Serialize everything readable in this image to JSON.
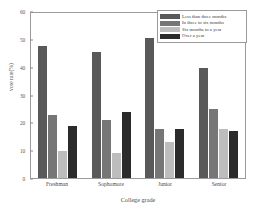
{
  "chart_data": {
    "type": "bar",
    "title": "",
    "xlabel": "College grade",
    "ylabel": "vote rate(%)",
    "categories": [
      "Freshman",
      "Sophomore",
      "Junior",
      "Senior"
    ],
    "ylim": [
      0,
      60
    ],
    "yticks": [
      0,
      10,
      20,
      30,
      40,
      50,
      60
    ],
    "grid": false,
    "legend_position": "top-right",
    "series": [
      {
        "name": "Less than three months",
        "color": "#595959",
        "values": [
          48,
          46,
          51,
          40
        ]
      },
      {
        "name": "In three to six months",
        "color": "#767676",
        "values": [
          23,
          21,
          18,
          25
        ]
      },
      {
        "name": "Six months to a year",
        "color": "#bdbdbd",
        "values": [
          10,
          9,
          13,
          18
        ]
      },
      {
        "name": "Over a year",
        "color": "#2b2b2b",
        "values": [
          19,
          24,
          18,
          17
        ]
      }
    ]
  }
}
